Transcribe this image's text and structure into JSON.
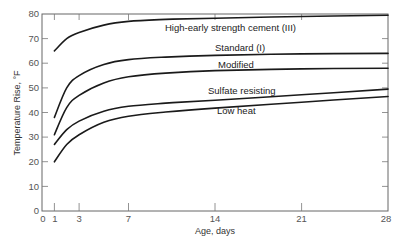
{
  "chart_data": {
    "type": "line",
    "title": "",
    "xlabel": "Age, days",
    "ylabel": "Temperature Rise, °F",
    "xlim": [
      0,
      28
    ],
    "ylim": [
      0,
      80
    ],
    "x_ticks": [
      0,
      1,
      3,
      7,
      14,
      21,
      28
    ],
    "y_ticks": [
      0,
      10,
      20,
      30,
      40,
      50,
      60,
      70,
      80
    ],
    "grid": false,
    "legend_position": "inline labels",
    "x": [
      1,
      2,
      3,
      5,
      7,
      10,
      14,
      21,
      28
    ],
    "series": [
      {
        "name": "High-early strength cement (III)",
        "values": [
          65,
          70,
          72.5,
          75.5,
          77,
          77.8,
          78.3,
          79,
          79.5
        ]
      },
      {
        "name": "Standard (I)",
        "values": [
          38,
          50,
          55,
          59.5,
          61.5,
          62.5,
          63.2,
          63.8,
          64
        ]
      },
      {
        "name": "Modified",
        "values": [
          31,
          42,
          47,
          52,
          54.5,
          56,
          57,
          57.7,
          58
        ]
      },
      {
        "name": "Sulfate resisting",
        "values": [
          27,
          33,
          36.5,
          40.5,
          42.5,
          43.8,
          45,
          47.2,
          49.5
        ]
      },
      {
        "name": "Low heat",
        "values": [
          20,
          27,
          31,
          36,
          38.5,
          40.2,
          41.8,
          44.2,
          46.5
        ]
      }
    ],
    "annotations": [
      {
        "text": "High-early strength cement (III)",
        "x": 10,
        "y": 74
      },
      {
        "text": "Standard (I)",
        "x": 14,
        "y": 66
      },
      {
        "text": "Modified",
        "x": 14,
        "y": 59.5
      },
      {
        "text": "Sulfate resisting",
        "x": 14,
        "y": 48.5
      },
      {
        "text": "Low heat",
        "x": 14,
        "y": 40.5
      }
    ]
  },
  "axes": {
    "x_label": "Age, days",
    "y_label": "Temperature Rise, °F",
    "x_tick_labels": [
      "0",
      "1",
      "3",
      "7",
      "14",
      "21",
      "28"
    ],
    "y_tick_labels": [
      "0",
      "10",
      "20",
      "30",
      "40",
      "50",
      "60",
      "70",
      "80"
    ]
  },
  "labels": {
    "high_early": "High-early strength cement (III)",
    "standard": "Standard (I)",
    "modified": "Modified",
    "sulfate": "Sulfate resisting",
    "low_heat": "Low heat"
  }
}
